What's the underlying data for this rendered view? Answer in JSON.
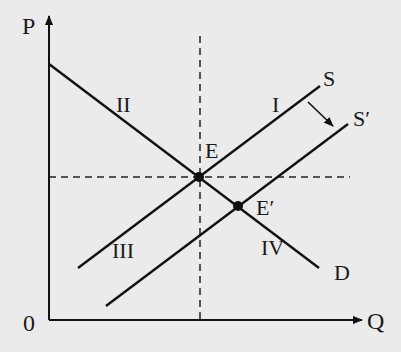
{
  "diagram": {
    "type": "supply-demand",
    "axes": {
      "y_label": "P",
      "x_label": "Q",
      "origin_label": "0"
    },
    "curves": {
      "demand": {
        "label": "D",
        "from": [
          49,
          64
        ],
        "to": [
          319,
          268
        ]
      },
      "supply": {
        "label": "S",
        "from": [
          78,
          268
        ],
        "to": [
          320,
          86
        ]
      },
      "supply_shifted": {
        "label": "S′",
        "from": [
          106,
          306
        ],
        "to": [
          348,
          124
        ]
      }
    },
    "points": {
      "equilibrium": {
        "label": "E",
        "x": 199,
        "y": 177
      },
      "new_equilibrium": {
        "label": "E′",
        "x": 238,
        "y": 206
      }
    },
    "regions": {
      "region_1": "I",
      "region_2": "II",
      "region_3": "III",
      "region_4": "IV"
    },
    "shift_arrow": {
      "from": [
        308,
        102
      ],
      "to": [
        333,
        126
      ]
    },
    "colors": {
      "ink": "#111111",
      "background": "#ebebeb"
    }
  }
}
